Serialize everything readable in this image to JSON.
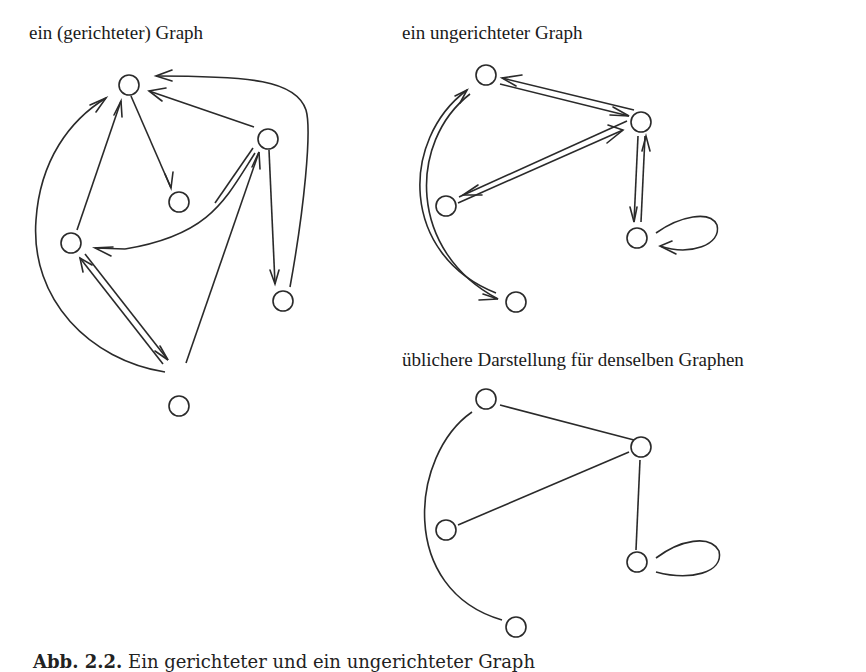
{
  "figure": {
    "panels": [
      {
        "id": "directed",
        "title": "ein (gerichteter) Graph",
        "type": "directed",
        "nodes": [
          {
            "id": "A",
            "x": 127,
            "y": 85
          },
          {
            "id": "B",
            "x": 267,
            "y": 139
          },
          {
            "id": "C",
            "x": 179,
            "y": 202
          },
          {
            "id": "D",
            "x": 71,
            "y": 243
          },
          {
            "id": "E",
            "x": 282,
            "y": 300
          },
          {
            "id": "F",
            "x": 179,
            "y": 406
          }
        ],
        "edges": [
          {
            "from": "A",
            "to": "C"
          },
          {
            "from": "B",
            "to": "A"
          },
          {
            "from": "E",
            "to": "A",
            "curved": true
          },
          {
            "from": "D",
            "to": "A"
          },
          {
            "from": "F",
            "to": "A",
            "curved": true
          },
          {
            "from": "B",
            "to": "D",
            "curved": true
          },
          {
            "from": "B",
            "to": "E"
          },
          {
            "from": "F",
            "to": "B"
          },
          {
            "from": "D",
            "to": "F"
          },
          {
            "from": "F",
            "to": "D"
          }
        ]
      },
      {
        "id": "undirected-arrows",
        "title": "ein ungerichteter Graph",
        "type": "undirected (shown as symmetric arcs)",
        "nodes": [
          {
            "id": "a",
            "x": 486,
            "y": 75
          },
          {
            "id": "b",
            "x": 641,
            "y": 122
          },
          {
            "id": "c",
            "x": 446,
            "y": 206
          },
          {
            "id": "d",
            "x": 637,
            "y": 238
          },
          {
            "id": "e",
            "x": 516,
            "y": 302
          }
        ],
        "edges": [
          {
            "between": [
              "a",
              "b"
            ]
          },
          {
            "between": [
              "b",
              "c"
            ]
          },
          {
            "between": [
              "b",
              "d"
            ]
          },
          {
            "between": [
              "a",
              "e"
            ],
            "curved": true
          },
          {
            "between": [
              "d",
              "d"
            ],
            "loop": true
          }
        ]
      },
      {
        "id": "undirected-usual",
        "title": "übliche­re Darstellung für denselben Graphen",
        "type": "undirected",
        "nodes": [
          {
            "id": "a",
            "x": 486,
            "y": 399
          },
          {
            "id": "b",
            "x": 641,
            "y": 447
          },
          {
            "id": "c",
            "x": 446,
            "y": 530
          },
          {
            "id": "d",
            "x": 637,
            "y": 562
          },
          {
            "id": "e",
            "x": 516,
            "y": 627
          }
        ],
        "edges": [
          {
            "between": [
              "a",
              "b"
            ]
          },
          {
            "between": [
              "b",
              "c"
            ]
          },
          {
            "between": [
              "b",
              "d"
            ]
          },
          {
            "between": [
              "a",
              "e"
            ],
            "curved": true
          },
          {
            "between": [
              "d",
              "d"
            ],
            "loop": true
          }
        ]
      }
    ],
    "labels": {
      "directed": "ein (gerichteter) Graph",
      "undirected": "ein ungerichteter Graph",
      "usual": "üblichere Darstellung für denselben Graphen"
    },
    "caption": {
      "number": "Abb. 2.2.",
      "text": " Ein gerichteter und ein ungerichteter Graph"
    }
  }
}
